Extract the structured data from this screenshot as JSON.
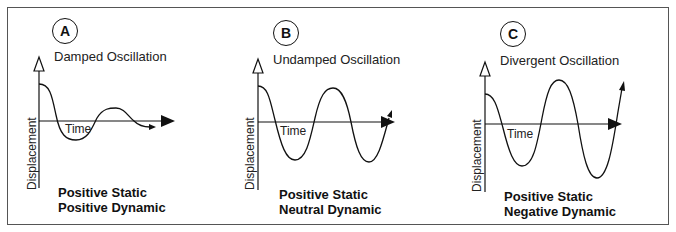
{
  "figure": {
    "panels": [
      {
        "id": "A",
        "title": "Damped Oscillation",
        "x_axis_label": "Time",
        "y_axis_label": "Displacement",
        "caption_line1": "Positive Static",
        "caption_line2": "Positive Dynamic",
        "behavior": "damped"
      },
      {
        "id": "B",
        "title": "Undamped Oscillation",
        "x_axis_label": "Time",
        "y_axis_label": "Displacement",
        "caption_line1": "Positive Static",
        "caption_line2": "Neutral Dynamic",
        "behavior": "undamped"
      },
      {
        "id": "C",
        "title": "Divergent Oscillation",
        "x_axis_label": "Time",
        "y_axis_label": "Displacement",
        "caption_line1": "Positive Static",
        "caption_line2": "Negative Dynamic",
        "behavior": "divergent"
      }
    ],
    "colors": {
      "line": "#111111",
      "frame": "#555555",
      "background": "#ffffff"
    }
  }
}
